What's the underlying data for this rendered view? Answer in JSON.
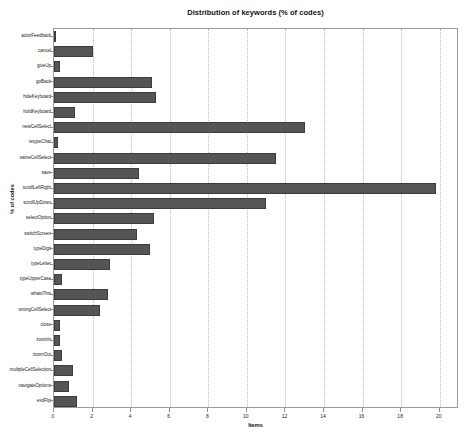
{
  "chart_data": {
    "type": "bar",
    "orientation": "horizontal",
    "title": "Distribution of keywords (% of codes)",
    "xlabel": "Items",
    "ylabel": "% of codes",
    "xlim": [
      0,
      21
    ],
    "ylim": [
      0,
      25
    ],
    "grid": true,
    "grid_axis": "x",
    "legend": false,
    "bar_color": "#555555",
    "bar_edge_color": "#3d3d3d",
    "background_color": "#ffffff",
    "frame_color": "#9a9a9a",
    "xticks": [
      0,
      2,
      4,
      6,
      8,
      10,
      12,
      14,
      16,
      18,
      20
    ],
    "xtick_labels": [
      "0",
      "2",
      "4",
      "6",
      "8",
      "10",
      "12",
      "14",
      "16",
      "18",
      "20"
    ],
    "categories": [
      "actorFeedback",
      "cancel",
      "giveUp",
      "goBack",
      "hideKeyboard",
      "holdKeyboard",
      "newCellSelect",
      "retypeChar",
      "sameCellSelect",
      "save",
      "scrollLeftRight",
      "scrollUpDown",
      "selectOption",
      "switchScreen",
      "typeDigit",
      "typeLetter",
      "typeUpperCase",
      "whatsThis",
      "wrongCellSelect",
      "close",
      "zoomIn",
      "zoomOut",
      "multipleCellSelection",
      "navigateOptions",
      "exitFlip"
    ],
    "values": [
      0.1,
      2.0,
      0.3,
      5.1,
      5.3,
      1.1,
      13.0,
      0.2,
      11.5,
      4.4,
      19.8,
      11.0,
      5.2,
      4.3,
      5.0,
      2.9,
      0.4,
      2.8,
      2.4,
      0.3,
      0.3,
      0.4,
      1.0,
      0.8,
      1.2
    ]
  }
}
